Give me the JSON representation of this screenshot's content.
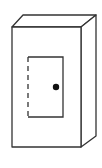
{
  "figure": {
    "stroke_color": "#333333",
    "fill_color": "#ffffff",
    "knob_color": "#111111"
  }
}
